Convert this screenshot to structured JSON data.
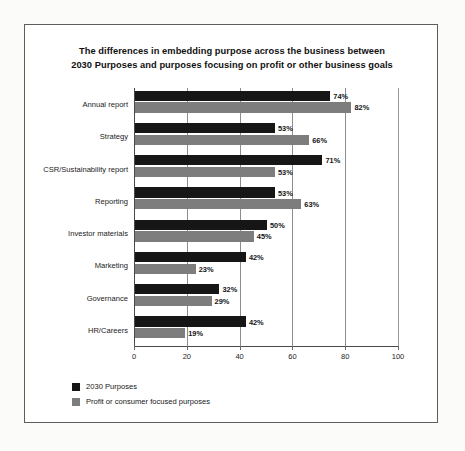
{
  "chart_data": {
    "type": "bar",
    "orientation": "horizontal",
    "title": "The differences in embedding purpose across the business between 2030 Purposes and purposes focusing on profit or other business goals",
    "title_lines": [
      "The differences in embedding purpose across the business between",
      "2030 Purposes and purposes focusing on profit or other business goals"
    ],
    "xlabel": "",
    "ylabel": "",
    "xlim": [
      0,
      100
    ],
    "xticks": [
      0,
      20,
      40,
      60,
      80,
      100
    ],
    "xtick_labels": [
      "0",
      "20",
      "40",
      "60",
      "80",
      "100"
    ],
    "grid": true,
    "grid_axis": "x",
    "legend_position": "bottom-left",
    "value_suffix": "%",
    "categories": [
      "Annual report",
      "Strategy",
      "CSR/Sustainability report",
      "Reporting",
      "Investor materials",
      "Marketing",
      "Governance",
      "HR/Careers"
    ],
    "series": [
      {
        "name": "2030 Purposes",
        "color": "#161616",
        "values": [
          74,
          53,
          71,
          53,
          50,
          42,
          32,
          42
        ],
        "labels": [
          "74%",
          "53%",
          "71%",
          "53%",
          "50%",
          "42%",
          "32%",
          "42%"
        ]
      },
      {
        "name": "Profit or consumer focused purposes",
        "color": "#7d7d7d",
        "values": [
          82,
          66,
          53,
          63,
          45,
          23,
          29,
          19
        ],
        "labels": [
          "82%",
          "66%",
          "53%",
          "63%",
          "45%",
          "23%",
          "29%",
          "19%"
        ]
      }
    ]
  },
  "colors": {
    "series_a": "#161616",
    "series_b": "#7d7d7d",
    "frame_border": "#5d5d5d",
    "gridline": "#8d8d8d",
    "axis": "#4a4a4a",
    "page_background": "#fbfbfa",
    "chart_background": "#ffffff"
  }
}
